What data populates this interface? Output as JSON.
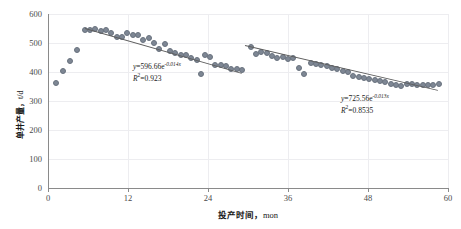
{
  "chart_data": {
    "type": "scatter",
    "title": "",
    "xlabel": "投产时间",
    "xlabel_unit": "mon",
    "ylabel": "单井产量",
    "ylabel_unit": "t/d",
    "xlim": [
      0,
      60
    ],
    "ylim": [
      0,
      600
    ],
    "xticks": [
      "0",
      "12",
      "24",
      "36",
      "48",
      "60"
    ],
    "yticks": [
      "0",
      "100",
      "200",
      "300",
      "400",
      "500",
      "600"
    ],
    "grid": true,
    "legend": "none",
    "marker_color": "#7e8794",
    "line_color": "#5d5d5d",
    "series": [
      {
        "name": "单井产量",
        "points": [
          [
            1.2,
            362
          ],
          [
            2.3,
            402
          ],
          [
            3.3,
            438
          ],
          [
            4.4,
            476
          ],
          [
            5.6,
            546
          ],
          [
            6.3,
            545
          ],
          [
            7.1,
            548
          ],
          [
            7.9,
            543
          ],
          [
            8.7,
            546
          ],
          [
            9.5,
            536
          ],
          [
            10.3,
            522
          ],
          [
            11.1,
            519
          ],
          [
            11.9,
            533
          ],
          [
            12.7,
            527
          ],
          [
            13.5,
            527
          ],
          [
            14.3,
            511
          ],
          [
            15.1,
            518
          ],
          [
            15.9,
            501
          ],
          [
            16.7,
            481
          ],
          [
            17.5,
            497
          ],
          [
            18.3,
            472
          ],
          [
            19.1,
            466
          ],
          [
            19.9,
            459
          ],
          [
            20.7,
            458
          ],
          [
            21.5,
            447
          ],
          [
            22.3,
            442
          ],
          [
            22.9,
            392
          ],
          [
            23.6,
            459
          ],
          [
            24.3,
            452
          ],
          [
            25.1,
            425
          ],
          [
            25.9,
            423
          ],
          [
            26.7,
            422
          ],
          [
            27.5,
            412
          ],
          [
            28.3,
            412
          ],
          [
            29.1,
            406
          ],
          [
            30.4,
            487
          ],
          [
            31.2,
            462
          ],
          [
            32.0,
            470
          ],
          [
            32.8,
            465
          ],
          [
            33.6,
            455
          ],
          [
            34.4,
            450
          ],
          [
            35.2,
            451
          ],
          [
            36.0,
            444
          ],
          [
            36.8,
            447
          ],
          [
            37.6,
            413
          ],
          [
            38.4,
            394
          ],
          [
            39.4,
            430
          ],
          [
            40.2,
            428
          ],
          [
            41.0,
            424
          ],
          [
            41.8,
            420
          ],
          [
            42.6,
            414
          ],
          [
            43.4,
            409
          ],
          [
            44.2,
            404
          ],
          [
            45.0,
            399
          ],
          [
            45.8,
            386
          ],
          [
            46.6,
            382
          ],
          [
            47.4,
            378
          ],
          [
            48.2,
            375
          ],
          [
            49.0,
            371
          ],
          [
            49.8,
            368
          ],
          [
            50.6,
            364
          ],
          [
            51.4,
            360
          ],
          [
            52.2,
            356
          ],
          [
            53.0,
            353
          ],
          [
            53.8,
            358
          ],
          [
            54.6,
            357
          ],
          [
            55.4,
            356
          ],
          [
            56.2,
            355
          ],
          [
            57.0,
            356
          ],
          [
            57.8,
            356
          ],
          [
            58.6,
            357
          ]
        ]
      }
    ],
    "fits": [
      {
        "id": "fit-1",
        "equation_prefix": "y=596.66e",
        "equation_exponent": "-0.014x",
        "r2_label": "R",
        "r2_sup": "2",
        "r2_value": "=0.923",
        "x_start": 5.6,
        "x_end": 29.1,
        "coef": 596.66,
        "rate": -0.014,
        "r2": 0.923
      },
      {
        "id": "fit-2",
        "equation_prefix": "y=725.56e",
        "equation_exponent": "-0.013x",
        "r2_label": "R",
        "r2_sup": "2",
        "r2_value": "=0.8535",
        "x_start": 29.6,
        "x_end": 58.6,
        "coef": 725.56,
        "rate": -0.013,
        "r2": 0.8535
      }
    ]
  }
}
